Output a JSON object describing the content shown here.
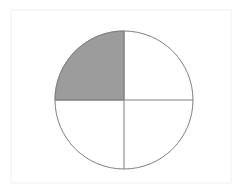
{
  "canvas": {
    "width": 247,
    "height": 196,
    "background_color": "#FFFFFF"
  },
  "frame": {
    "x": 11,
    "y": 10,
    "width": 220,
    "height": 173,
    "stroke_color": "#F2F2F2",
    "stroke_width": 1.2,
    "fill_color": "#FFFFFF"
  },
  "figure": {
    "kind": "fraction-circle",
    "shaded_fraction": "1/4",
    "shaded_parts": 1,
    "total_parts": 4,
    "shaded_quadrant": "upper-left"
  },
  "chart_data": {
    "type": "pie",
    "title": "",
    "subtitle": "",
    "xlabel": "",
    "ylabel": "",
    "grid": false,
    "legend_position": "none",
    "labels": [
      "Shaded",
      "Unshaded",
      "Unshaded",
      "Unshaded"
    ],
    "values": [
      25,
      25,
      25,
      25
    ],
    "slice_colors": [
      "#9C9C9C",
      "#FFFFFF",
      "#FFFFFF",
      "#FFFFFF"
    ],
    "slice_quadrants": [
      "upper-left",
      "upper-right",
      "lower-right",
      "lower-left"
    ],
    "start_angle_deg": 90,
    "direction": "counterclockwise",
    "annotations": []
  },
  "circle": {
    "center_x": 124,
    "center_y": 100,
    "radius": 69,
    "stroke_color": "#7F7F7F",
    "stroke_width": 1,
    "fill_color": "#FFFFFF"
  },
  "shaded_sector": {
    "fill_color": "#9C9C9C",
    "stroke_color": "#7F7F7F",
    "stroke_width": 1,
    "start_angle_deg": 90,
    "end_angle_deg": 180
  },
  "divider_lines": [
    {
      "name": "vertical-diameter",
      "x1": 124,
      "y1": 31,
      "x2": 124,
      "y2": 169,
      "stroke_color": "#808080",
      "stroke_width": 1
    },
    {
      "name": "horizontal-diameter",
      "x1": 55,
      "y1": 100,
      "x2": 193,
      "y2": 100,
      "stroke_color": "#808080",
      "stroke_width": 1
    }
  ]
}
